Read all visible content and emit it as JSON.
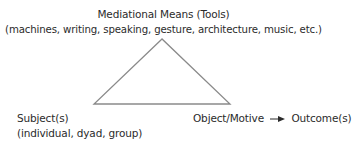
{
  "diagram": {
    "type": "activity-theory-triangle",
    "apex": {
      "title": "Mediational Means (Tools)",
      "subtitle": "(machines, writing, speaking, gesture, architecture, music, etc.)"
    },
    "bottom_left": {
      "title": "Subject(s)",
      "subtitle": "(individual, dyad, group)"
    },
    "bottom_right": {
      "object": "Object/Motive",
      "outcome": "Outcome(s)",
      "connector": "arrow-right"
    },
    "triangle": {
      "vertices": [
        [
          162,
          39
        ],
        [
          94,
          104
        ],
        [
          230,
          104
        ]
      ],
      "stroke_color": "#8a8a8a",
      "stroke_width": 1.3
    },
    "colors": {
      "text": "#2b2b2b",
      "line": "#8a8a8a",
      "background": "#ffffff"
    }
  }
}
